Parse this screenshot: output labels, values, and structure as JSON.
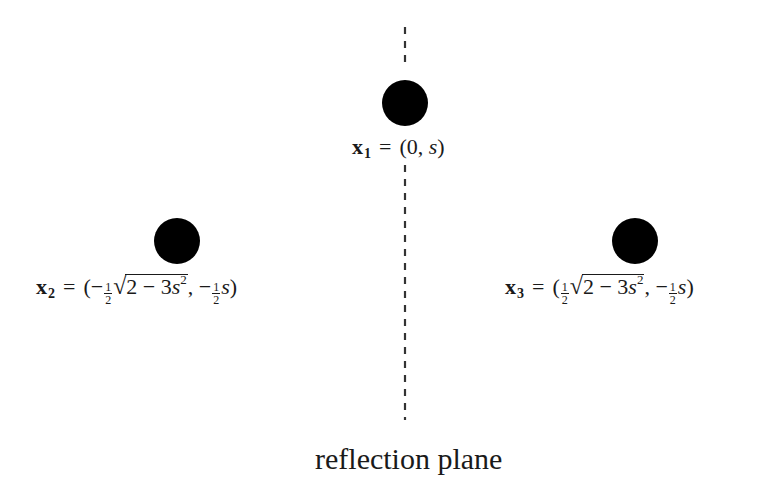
{
  "diagram": {
    "plane": {
      "label": "reflection plane",
      "x": 405,
      "segments": [
        [
          27,
          67
        ],
        [
          165,
          420
        ]
      ],
      "dash": "7 7",
      "color": "#333333"
    },
    "points": [
      {
        "id": "x1",
        "center": [
          405,
          103
        ],
        "radius": 23,
        "color": "#000000",
        "label": {
          "symbol": "x",
          "index": "1",
          "equals": "=",
          "open": "(",
          "x_value": "0",
          "comma": ",",
          "y_value": "s",
          "close": ")"
        }
      },
      {
        "id": "x2",
        "center": [
          177,
          241
        ],
        "radius": 23,
        "color": "#000000",
        "label": {
          "symbol": "x",
          "index": "2",
          "equals": "=",
          "open": "(",
          "x_sign": "−",
          "frac_num": "1",
          "frac_den": "2",
          "radical": "√",
          "radicand_a": "2 − 3",
          "radicand_var": "s",
          "radicand_exp": "2",
          "comma": ",",
          "y_sign": "−",
          "y_var": "s",
          "close": ")"
        }
      },
      {
        "id": "x3",
        "center": [
          635,
          241
        ],
        "radius": 23,
        "color": "#000000",
        "label": {
          "symbol": "x",
          "index": "3",
          "equals": "=",
          "open": "(",
          "frac_num": "1",
          "frac_den": "2",
          "radical": "√",
          "radicand_a": "2 − 3",
          "radicand_var": "s",
          "radicand_exp": "2",
          "comma": ",",
          "y_sign": "−",
          "y_var": "s",
          "close": ")"
        }
      }
    ]
  }
}
